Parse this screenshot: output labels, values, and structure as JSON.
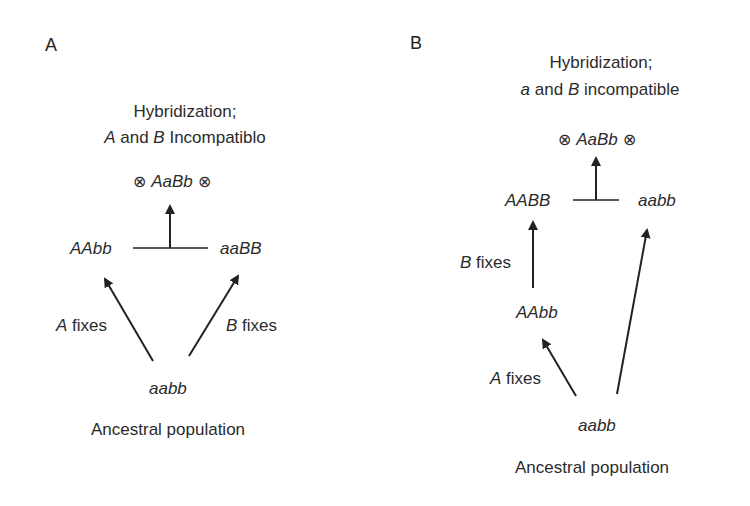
{
  "panels": [
    {
      "id": "A",
      "letter": "A",
      "title_line1": "Hybridization;",
      "title_line2_prefix_italic": "A",
      "title_line2_mid": " and ",
      "title_line2_second_italic": "B",
      "title_line2_suffix": " Incompatiblo",
      "hybrid": {
        "left_icon": "⊗",
        "genotype": "AaBb",
        "right_icon": "⊗"
      },
      "left_parent": "AAbb",
      "right_parent": "aaBB",
      "left_arrow_label_italic": "A",
      "left_arrow_label_rest": " fixes",
      "right_arrow_label_italic": "B",
      "right_arrow_label_rest": " fixes",
      "ancestor": "aabb",
      "ancestor_caption": "Ancestral population"
    },
    {
      "id": "B",
      "letter": "B",
      "title_line1": "Hybridization;",
      "title_line2_prefix_italic": "a",
      "title_line2_mid": " and ",
      "title_line2_second_italic": "B",
      "title_line2_suffix": " incompatible",
      "hybrid": {
        "left_icon": "⊗",
        "genotype": "AaBb",
        "right_icon": "⊗"
      },
      "left_parent": "AABB",
      "right_parent": "aabb",
      "intermediate": "AAbb",
      "upper_arrow_label_italic": "B",
      "upper_arrow_label_rest": " fixes",
      "lower_arrow_label_italic": "A",
      "lower_arrow_label_rest": " fixes",
      "ancestor": "aabb",
      "ancestor_caption": "Ancestral population"
    }
  ],
  "colors": {
    "ink": "#2b2b2b",
    "background": "#ffffff"
  }
}
